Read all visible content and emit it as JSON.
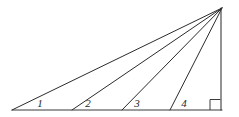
{
  "figure": {
    "kind": "geometry-diagram",
    "background_color": "#ffffff",
    "line_color": "#2b2b2b",
    "label_color": "#1f1f1f",
    "apex": {
      "x": 222,
      "y": 8
    },
    "left_vertex": {
      "x": 12,
      "y": 110
    },
    "right_vertex": {
      "x": 221,
      "y": 110
    },
    "baseline": {
      "x1": 12,
      "y1": 110,
      "x2": 222,
      "y2": 110
    },
    "vertical_edge": {
      "x1": 221,
      "y1": 8,
      "x2": 221,
      "y2": 110
    },
    "right_angle_marker": {
      "name": "right-angle",
      "size": 11,
      "corner_x": 221,
      "corner_y": 110
    },
    "rays": [
      {
        "name": "ray-hypotenuse",
        "base_x": 12,
        "base_y": 110,
        "tip_x": 222,
        "tip_y": 8
      },
      {
        "name": "ray-2",
        "base_x": 72,
        "base_y": 110,
        "tip_x": 222,
        "tip_y": 8
      },
      {
        "name": "ray-3",
        "base_x": 122,
        "base_y": 110,
        "tip_x": 222,
        "tip_y": 8
      },
      {
        "name": "ray-4",
        "base_x": 170,
        "base_y": 110,
        "tip_x": 222,
        "tip_y": 8
      }
    ],
    "angle_labels": [
      {
        "text": "1",
        "x": 40,
        "y": 107
      },
      {
        "text": "2",
        "x": 88,
        "y": 107
      },
      {
        "text": "3",
        "x": 137,
        "y": 107
      },
      {
        "text": "4",
        "x": 184,
        "y": 107
      }
    ]
  }
}
